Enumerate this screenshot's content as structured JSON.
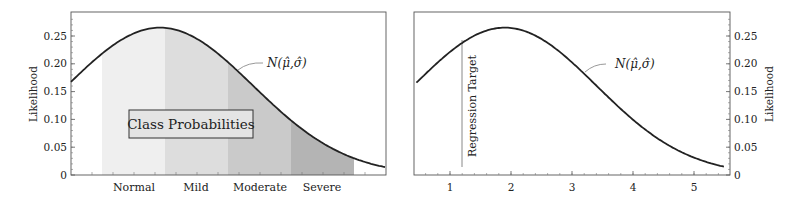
{
  "chart_data": [
    {
      "type": "area",
      "panel": "left",
      "title": "",
      "xlabel": "",
      "ylabel": "Likelihood",
      "ylim": [
        0,
        0.29
      ],
      "yticks": [
        "0",
        "0.05",
        "0.10",
        "0.15",
        "0.20",
        "0.25"
      ],
      "categories": [
        "Normal",
        "Mild",
        "Moderate",
        "Severe"
      ],
      "band_shades": [
        "#efefef",
        "#dcdcdc",
        "#c8c8c8",
        "#b2b2b2"
      ],
      "curve": {
        "label": "N(μ̂,σ̂)",
        "mean_px_frac": 0.28,
        "peak": 0.265,
        "start": 0.17,
        "end": 0.015
      },
      "annotation_box": "Class Probabilities",
      "grid": false,
      "legend": "none"
    },
    {
      "type": "line",
      "panel": "right",
      "title": "",
      "xlabel": "",
      "ylabel": "Likelihood",
      "ylabel_side": "right",
      "xlim": [
        0.4,
        5.6
      ],
      "xticks": [
        "1",
        "2",
        "3",
        "4",
        "5"
      ],
      "ylim": [
        0,
        0.29
      ],
      "yticks": [
        "0",
        "0.05",
        "0.10",
        "0.15",
        "0.20",
        "0.25"
      ],
      "curve": {
        "label": "N(μ̂,σ̂)",
        "mean": 1.9,
        "sigma": 1.5,
        "peak": 0.265
      },
      "regression_target": {
        "label": "Regression Target",
        "x": 1.2
      },
      "grid": false,
      "legend": "none"
    }
  ],
  "labels": {
    "ylabel": "Likelihood",
    "curve_label": "N(μ̂,σ̂)",
    "box": "Class Probabilities",
    "target": "Regression Target",
    "yticks": [
      "0",
      "0.05",
      "0.10",
      "0.15",
      "0.20",
      "0.25"
    ],
    "xticks_right": [
      "1",
      "2",
      "3",
      "4",
      "5"
    ],
    "categories": [
      "Normal",
      "Mild",
      "Moderate",
      "Severe"
    ]
  }
}
